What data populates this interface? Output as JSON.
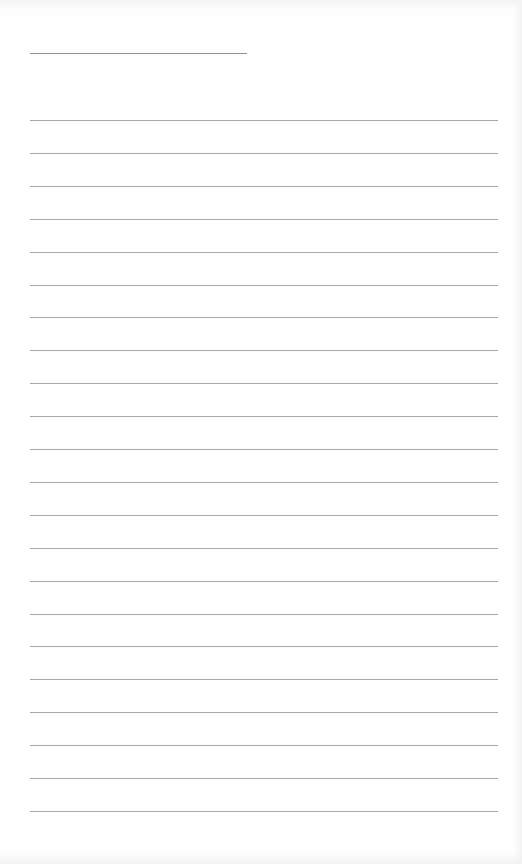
{
  "page": {
    "type": "lined notebook page",
    "background": "#fefefe",
    "line_color": "#a8a8a8",
    "title_line": {
      "present": true,
      "text": ""
    },
    "ruled_line_count": 22,
    "lines": [
      "",
      "",
      "",
      "",
      "",
      "",
      "",
      "",
      "",
      "",
      "",
      "",
      "",
      "",
      "",
      "",
      "",
      "",
      "",
      "",
      "",
      ""
    ]
  }
}
